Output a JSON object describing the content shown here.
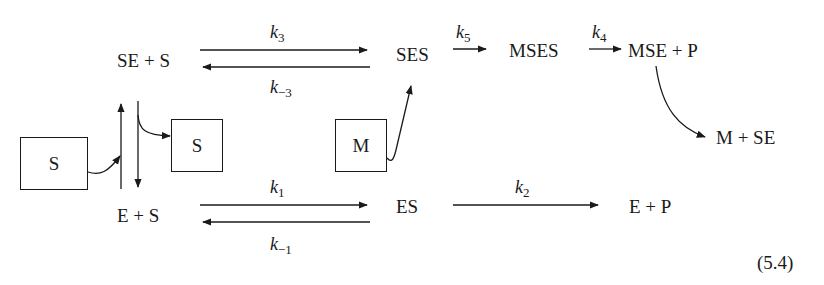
{
  "diagram": {
    "species": {
      "se_plus_s": "SE + S",
      "ses": "SES",
      "mses": "MSES",
      "mse_plus_p": "MSE + P",
      "m_plus_se": "M + SE",
      "e_plus_s": "E + S",
      "es": "ES",
      "e_plus_p": "E + P"
    },
    "rate_constants": {
      "k3": {
        "base": "k",
        "sub": "3"
      },
      "k_minus_3": {
        "base": "k",
        "sub": "−3"
      },
      "k5": {
        "base": "k",
        "sub": "5"
      },
      "k4": {
        "base": "k",
        "sub": "4"
      },
      "k1": {
        "base": "k",
        "sub": "1"
      },
      "k_minus_1": {
        "base": "k",
        "sub": "−1"
      },
      "k2": {
        "base": "k",
        "sub": "2"
      }
    },
    "boxes": {
      "substrate_in": "S",
      "substrate_out": "S",
      "modifier": "M"
    },
    "equation_number": "(5.4)",
    "colors": {
      "ink": "#1a1a1a",
      "background": "#ffffff"
    }
  }
}
